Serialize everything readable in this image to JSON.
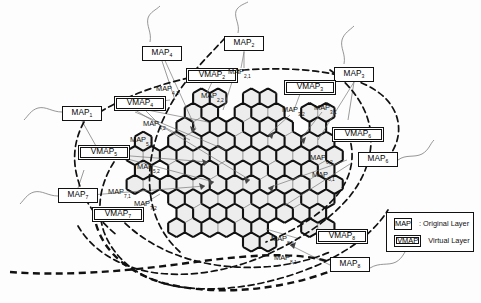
{
  "figure": {
    "type": "network-topology-diagram"
  },
  "legend": {
    "title": "",
    "rows": [
      {
        "key": "MAP",
        "label": ": Original Layer",
        "kind": "map"
      },
      {
        "key": "VMAP",
        "label": "Virtual Layer",
        "kind": "vmap"
      }
    ]
  },
  "nodes": [
    {
      "id": "map4",
      "type": "MAP",
      "base": "MAP",
      "sub": "4",
      "x": 142,
      "y": 46,
      "w": 40
    },
    {
      "id": "map2",
      "type": "MAP",
      "base": "MAP",
      "sub": "2",
      "x": 224,
      "y": 36,
      "w": 40
    },
    {
      "id": "map3",
      "type": "MAP",
      "base": "MAP",
      "sub": "3",
      "x": 334,
      "y": 67,
      "w": 40
    },
    {
      "id": "map1",
      "type": "MAP",
      "base": "MAP",
      "sub": "1",
      "x": 62,
      "y": 106,
      "w": 40
    },
    {
      "id": "map6",
      "type": "MAP",
      "base": "MAP",
      "sub": "6",
      "x": 358,
      "y": 152,
      "w": 40
    },
    {
      "id": "map7",
      "type": "MAP",
      "base": "MAP",
      "sub": "7",
      "x": 58,
      "y": 188,
      "w": 40
    },
    {
      "id": "map8",
      "type": "MAP",
      "base": "MAP",
      "sub": "8",
      "x": 330,
      "y": 257,
      "w": 40
    },
    {
      "id": "vmap2",
      "type": "VMAP",
      "base": "VMAP",
      "sub": "2",
      "x": 186,
      "y": 68,
      "w": 52
    },
    {
      "id": "vmap3",
      "type": "VMAP",
      "base": "VMAP",
      "sub": "3",
      "x": 284,
      "y": 80,
      "w": 52
    },
    {
      "id": "vmap4",
      "type": "VMAP",
      "base": "VMAP",
      "sub": "4",
      "x": 114,
      "y": 96,
      "w": 52
    },
    {
      "id": "vmap6",
      "type": "VMAP",
      "base": "VMAP",
      "sub": "6",
      "x": 332,
      "y": 127,
      "w": 52
    },
    {
      "id": "vmap5",
      "type": "VMAP",
      "base": "VMAP",
      "sub": "5",
      "x": 78,
      "y": 145,
      "w": 52
    },
    {
      "id": "vmap7",
      "type": "VMAP",
      "base": "VMAP",
      "sub": "7",
      "x": 92,
      "y": 207,
      "w": 52
    },
    {
      "id": "vmap8",
      "type": "VMAP",
      "base": "VMAP",
      "sub": "8",
      "x": 316,
      "y": 229,
      "w": 52
    }
  ],
  "sublabels": [
    {
      "id": "m21",
      "base": "MAP",
      "sub": "2,1",
      "x": 228,
      "y": 68
    },
    {
      "id": "m41",
      "base": "MAP",
      "sub": "4,1",
      "x": 156,
      "y": 85
    },
    {
      "id": "m22",
      "base": "MAP",
      "sub": "2,2",
      "x": 201,
      "y": 92
    },
    {
      "id": "m32",
      "base": "MAP",
      "sub": "3,2",
      "x": 282,
      "y": 106
    },
    {
      "id": "m31",
      "base": "MAP",
      "sub": "3,1",
      "x": 314,
      "y": 104
    },
    {
      "id": "m42",
      "base": "MAP",
      "sub": "4,2",
      "x": 143,
      "y": 120
    },
    {
      "id": "m51",
      "base": "MAP",
      "sub": "5,1",
      "x": 130,
      "y": 136
    },
    {
      "id": "m62",
      "base": "MAP",
      "sub": "6,2",
      "x": 310,
      "y": 154
    },
    {
      "id": "m52",
      "base": "MAP",
      "sub": "5,2",
      "x": 137,
      "y": 163
    },
    {
      "id": "m61",
      "base": "MAP",
      "sub": "6,1",
      "x": 312,
      "y": 171
    },
    {
      "id": "m71",
      "base": "MAP",
      "sub": "7,1",
      "x": 108,
      "y": 188
    },
    {
      "id": "m72",
      "base": "MAP",
      "sub": "7,2",
      "x": 134,
      "y": 200
    },
    {
      "id": "m82",
      "base": "MAP",
      "sub": "8,2",
      "x": 271,
      "y": 235
    },
    {
      "id": "m81",
      "base": "MAP",
      "sub": "8,1",
      "x": 274,
      "y": 254
    }
  ],
  "colors": {
    "ink": "#111111",
    "cell_fill": "#eeeeee",
    "cell_stroke": "#8a8a8a",
    "cluster_stroke": "#111111",
    "background": "#ffffff"
  }
}
